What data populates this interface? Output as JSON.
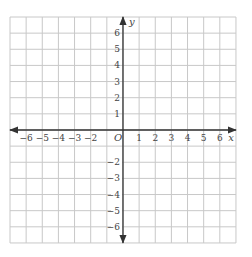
{
  "grid": {
    "x_min": -7,
    "x_max": 7,
    "y_min": -7,
    "y_max": 7,
    "left_px": 10,
    "top_px": 17,
    "cell_px": 16.14,
    "line_color": "#c8c8c8",
    "axis_color": "#333333"
  },
  "axes": {
    "x_label": "x",
    "y_label": "y",
    "origin_label": "O"
  },
  "x_ticks": [
    {
      "value": -6,
      "label": "−6"
    },
    {
      "value": -5,
      "label": "−5"
    },
    {
      "value": -4,
      "label": "−4"
    },
    {
      "value": -3,
      "label": "−3"
    },
    {
      "value": -2,
      "label": "−2"
    },
    {
      "value": 1,
      "label": "1"
    },
    {
      "value": 2,
      "label": "2"
    },
    {
      "value": 3,
      "label": "3"
    },
    {
      "value": 4,
      "label": "4"
    },
    {
      "value": 5,
      "label": "5"
    },
    {
      "value": 6,
      "label": "6"
    }
  ],
  "y_ticks": [
    {
      "value": 6,
      "label": "6"
    },
    {
      "value": 5,
      "label": "5"
    },
    {
      "value": 4,
      "label": "4"
    },
    {
      "value": 3,
      "label": "3"
    },
    {
      "value": 2,
      "label": "2"
    },
    {
      "value": 1,
      "label": "1"
    },
    {
      "value": -2,
      "label": "−2"
    },
    {
      "value": -3,
      "label": "−3"
    },
    {
      "value": -4,
      "label": "−4"
    },
    {
      "value": -5,
      "label": "−5"
    },
    {
      "value": -6,
      "label": "−6"
    }
  ]
}
